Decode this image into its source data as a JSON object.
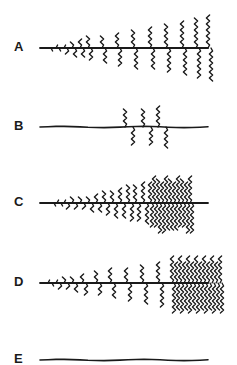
{
  "figure": {
    "panels": [
      {
        "label": "A",
        "baseline_y": 48,
        "x_start": 40,
        "x_end": 210,
        "description": "backbone with paired branches increasing in length left to right"
      },
      {
        "label": "B",
        "baseline_y": 127,
        "x_start": 40,
        "x_end": 212,
        "description": "backbone with three paired branches near middle-right"
      },
      {
        "label": "C",
        "baseline_y": 203,
        "x_start": 40,
        "x_end": 212,
        "description": "backbone with growing branches and dense cluster at right"
      },
      {
        "label": "D",
        "baseline_y": 283,
        "x_start": 40,
        "x_end": 213,
        "description": "backbone with growing branches and wide dense cluster at far right"
      },
      {
        "label": "E",
        "baseline_y": 360,
        "x_start": 40,
        "x_end": 213,
        "description": "plain backbone with no branches"
      }
    ],
    "line_color": "#1a1a1a",
    "background": "#ffffff"
  }
}
